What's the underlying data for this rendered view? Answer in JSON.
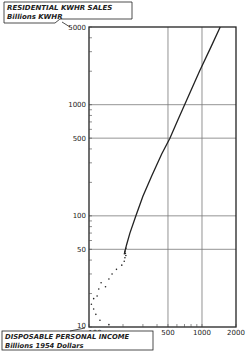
{
  "chart_data": {
    "type": "scatter",
    "title": "",
    "ylabel": "RESIDENTIAL KWHR SALES",
    "ylabel_units": "Billions KWHR",
    "xlabel": "DISPOSABLE PERSONAL INCOME",
    "xlabel_units": "Billions 1954 Dollars",
    "xscale": "log",
    "yscale": "log",
    "xlim": [
      100,
      2000
    ],
    "ylim": [
      10,
      5000
    ],
    "x_ticks": [
      "100",
      "500",
      "1000",
      "2000"
    ],
    "y_ticks": [
      "10",
      "50",
      "100",
      "500",
      "1000",
      "5000"
    ],
    "grid": {
      "x": [
        500,
        1000
      ],
      "y": [
        50,
        100,
        500,
        1000
      ]
    },
    "series": [
      {
        "name": "historical",
        "style": "dots",
        "x": [
          150,
          125,
          115,
          110,
          105,
          110,
          118,
          122,
          140,
          128,
          150,
          160,
          175,
          195,
          205,
          208,
          212,
          210,
          208,
          212
        ],
        "y": [
          10.5,
          11.5,
          13,
          14.5,
          16,
          18,
          19,
          22,
          23,
          25,
          27,
          30,
          33,
          36,
          39,
          42,
          44,
          46,
          48,
          51
        ]
      },
      {
        "name": "projection",
        "style": "line",
        "x": [
          205,
          215,
          230,
          260,
          300,
          360,
          440,
          520,
          620,
          760,
          950,
          1200,
          1450
        ],
        "y": [
          45,
          55,
          70,
          100,
          150,
          230,
          360,
          500,
          750,
          1200,
          2000,
          3300,
          5000
        ]
      }
    ]
  }
}
